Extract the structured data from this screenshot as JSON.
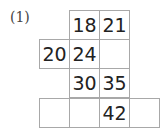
{
  "problem": {
    "label": "(1)",
    "grid": {
      "rows": [
        {
          "cells": [
            {
              "col": 2,
              "value": "18"
            },
            {
              "col": 3,
              "value": "21"
            }
          ]
        },
        {
          "cells": [
            {
              "col": 1,
              "value": "20"
            },
            {
              "col": 2,
              "value": "24"
            },
            {
              "col": 3,
              "value": ""
            }
          ]
        },
        {
          "cells": [
            {
              "col": 2,
              "value": "30"
            },
            {
              "col": 3,
              "value": "35"
            }
          ]
        },
        {
          "cells": [
            {
              "col": 1,
              "value": ""
            },
            {
              "col": 2,
              "value": ""
            },
            {
              "col": 3,
              "value": "42"
            },
            {
              "col": 4,
              "value": ""
            }
          ]
        }
      ]
    }
  },
  "colors": {
    "grid_line": "#a8a8a8",
    "text": "#222222",
    "label": "#444444"
  }
}
